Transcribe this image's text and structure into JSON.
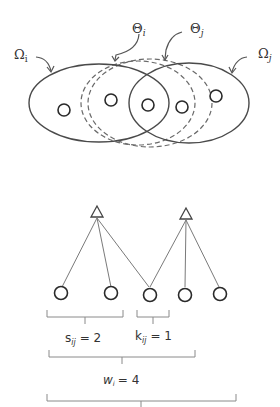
{
  "venn": {
    "sets": [
      {
        "id": "omega_i",
        "label": "Ω",
        "sub": "i",
        "style": "solid"
      },
      {
        "id": "omega_j",
        "label": "Ω",
        "sub": "j",
        "style": "solid"
      },
      {
        "id": "theta_i",
        "label": "Θ",
        "sub": "i",
        "style": "dashed"
      },
      {
        "id": "theta_j",
        "label": "Θ",
        "sub": "j",
        "style": "dashed"
      }
    ],
    "element_count": 5
  },
  "tree": {
    "parents": 2,
    "children": 5,
    "edges": [
      [
        0,
        0
      ],
      [
        0,
        1
      ],
      [
        0,
        2
      ],
      [
        1,
        2
      ],
      [
        1,
        3
      ],
      [
        1,
        4
      ]
    ]
  },
  "annotations": {
    "s": {
      "sym": "s",
      "sub": "ij",
      "eq": "= 2"
    },
    "k": {
      "sym": "k",
      "sub": "ij",
      "eq": "= 1"
    },
    "w": {
      "sym": "w",
      "sub": "i",
      "eq": "= 4"
    }
  },
  "colors": {
    "stroke": "#4a4a4a",
    "dashed": "#6a6a6a",
    "brace": "#8a8a8a"
  }
}
